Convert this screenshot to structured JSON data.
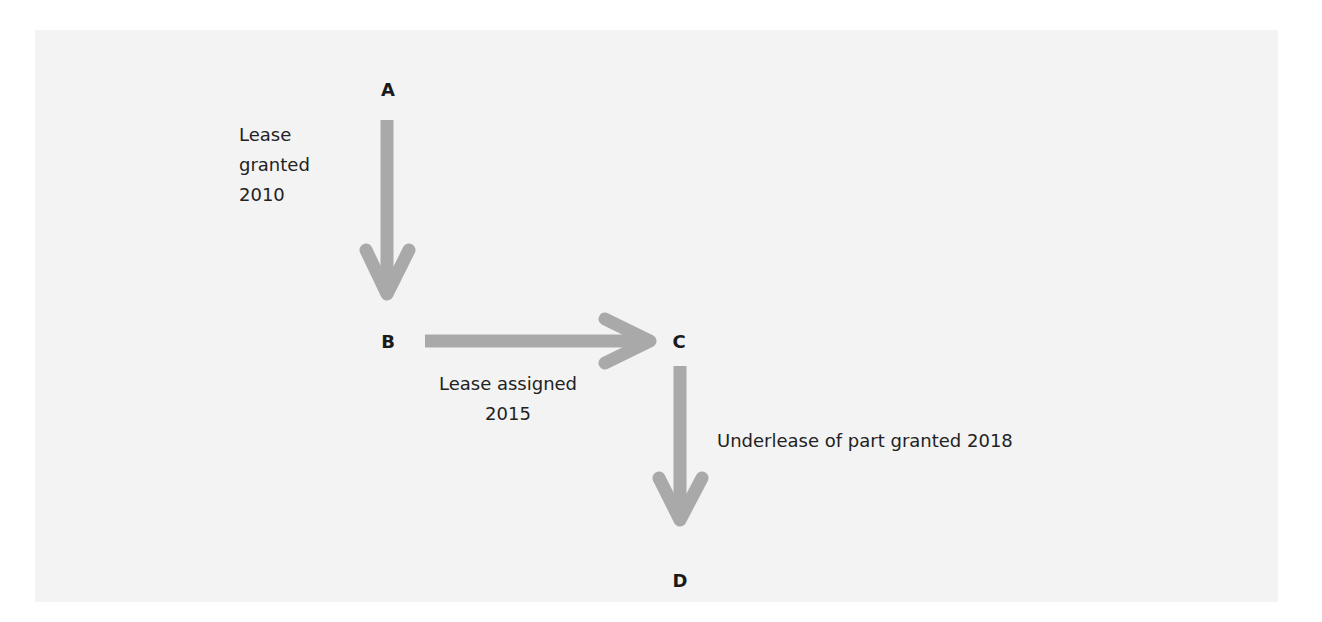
{
  "diagram": {
    "title": "",
    "colors": {
      "background": "#f3f3f3",
      "arrow": "#a9a9a9",
      "text": "#222222"
    },
    "nodes": [
      {
        "id": "A",
        "label": "A"
      },
      {
        "id": "B",
        "label": "B"
      },
      {
        "id": "C",
        "label": "C"
      },
      {
        "id": "D",
        "label": "D"
      }
    ],
    "edges": [
      {
        "from": "A",
        "to": "B",
        "label_lines": [
          "Lease",
          "granted",
          "2010"
        ]
      },
      {
        "from": "B",
        "to": "C",
        "label_lines": [
          "Lease assigned",
          "2015"
        ]
      },
      {
        "from": "C",
        "to": "D",
        "label_lines": [
          "Underlease of part granted 2018"
        ]
      }
    ]
  }
}
